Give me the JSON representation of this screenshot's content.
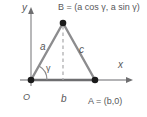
{
  "figure": {
    "axes": {
      "x_label": "x",
      "y_label": "y",
      "origin_label": "O"
    },
    "points": [
      {
        "name": "O",
        "label": "O",
        "x": 31,
        "y": 80
      },
      {
        "name": "A",
        "label": "A = (b,0)",
        "x": 95,
        "y": 80
      },
      {
        "name": "B",
        "label": "B = (a cos γ, a sin γ)",
        "x": 63,
        "y": 23
      }
    ],
    "sides": [
      {
        "name": "a",
        "label": "a",
        "from": "O",
        "to": "B"
      },
      {
        "name": "b",
        "label": "b",
        "from": "O",
        "to": "A"
      },
      {
        "name": "c",
        "label": "c",
        "from": "B",
        "to": "A"
      }
    ],
    "angle": {
      "name": "gamma",
      "label": "γ",
      "at": "O"
    },
    "dashed_altitude": {
      "name": "altitude-from-B",
      "from": "B",
      "to_x_axis": true
    },
    "colors": {
      "axis": "#9a9a9c",
      "triangle_side": "#8c8c8e",
      "base": "#6e6e70",
      "dashed": "#a8a8aa",
      "point_fill": "#1a1a1a",
      "text": "#58585a",
      "background": "#ffffff"
    }
  }
}
